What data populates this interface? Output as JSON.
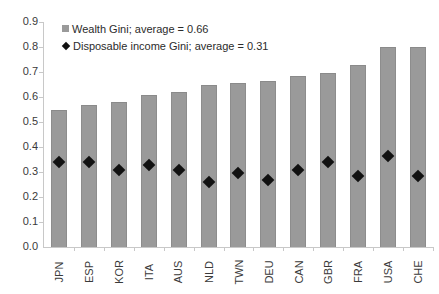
{
  "chart_data": {
    "type": "bar",
    "title": "",
    "xlabel": "",
    "ylabel": "",
    "ylim": [
      0.0,
      0.9
    ],
    "ytick_step": 0.1,
    "grid": false,
    "legend_position": "top-left",
    "categories": [
      "JPN",
      "ESP",
      "KOR",
      "ITA",
      "AUS",
      "NLD",
      "TWN",
      "DEU",
      "CAN",
      "GBR",
      "FRA",
      "USA",
      "CHE"
    ],
    "ytick_labels": [
      "0.9",
      "0.8",
      "0.7",
      "0.6",
      "0.5",
      "0.4",
      "0.3",
      "0.2",
      "0.1",
      "0.0"
    ],
    "ytick_values": [
      0.9,
      0.8,
      0.7,
      0.6,
      0.5,
      0.4,
      0.3,
      0.2,
      0.1,
      0.0
    ],
    "series": [
      {
        "name": "Wealth Gini; average = 0.66",
        "type": "bar",
        "color": "#9a9a9a",
        "marker": "square",
        "values": [
          0.55,
          0.57,
          0.58,
          0.61,
          0.62,
          0.65,
          0.655,
          0.665,
          0.685,
          0.695,
          0.73,
          0.8,
          0.8
        ]
      },
      {
        "name": "Disposable income Gini; average = 0.31",
        "type": "scatter",
        "color": "#111111",
        "marker": "diamond",
        "values": [
          0.34,
          0.34,
          0.31,
          0.33,
          0.31,
          0.26,
          0.295,
          0.27,
          0.31,
          0.34,
          0.285,
          0.365,
          0.285
        ]
      }
    ]
  },
  "legend": {
    "items": [
      {
        "label": "Wealth Gini; average = 0.66",
        "marker": "square",
        "color": "#9a9a9a"
      },
      {
        "label": "Disposable income Gini; average = 0.31",
        "marker": "diamond",
        "color": "#111111"
      }
    ]
  },
  "colors": {
    "bar_fill": "#9a9a9a",
    "marker_fill": "#111111",
    "axis": "#c8c8c8",
    "text": "#3a3a3a",
    "background": "#ffffff"
  }
}
